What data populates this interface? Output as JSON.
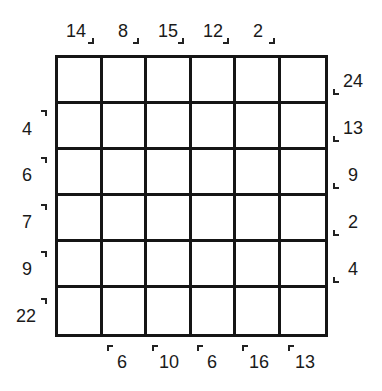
{
  "puzzle": {
    "rows": 6,
    "cols": 6,
    "top_clues": [
      "14",
      "8",
      "15",
      "12",
      "2"
    ],
    "right_clues": [
      "24",
      "13",
      "9",
      "2",
      "4"
    ],
    "left_clues": [
      "4",
      "6",
      "7",
      "9",
      "22"
    ],
    "bottom_clues": [
      "6",
      "10",
      "6",
      "16",
      "13"
    ]
  }
}
